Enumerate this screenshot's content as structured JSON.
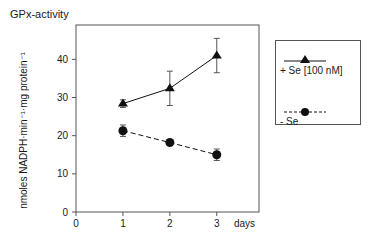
{
  "chart_data": {
    "type": "line",
    "title": "GPx-activity",
    "xlabel": "days",
    "ylabel": "nmoles NADPH·min⁻¹·mg protein⁻¹",
    "x": [
      1,
      2,
      3
    ],
    "xlim": [
      0,
      3.9
    ],
    "ylim": [
      0,
      49
    ],
    "xticks": [
      "0",
      "1",
      "2",
      "3"
    ],
    "yticks": [
      "0",
      "10",
      "20",
      "30",
      "40"
    ],
    "grid": false,
    "legend_position": "right",
    "series": [
      {
        "name": "+ Se [100 nM]",
        "marker": "triangle",
        "line_style": "solid",
        "values": [
          28.4,
          32.4,
          41.0
        ],
        "errors": [
          1.0,
          4.5,
          4.5
        ]
      },
      {
        "name": "- Se",
        "marker": "circle",
        "line_style": "dashed",
        "values": [
          21.3,
          18.2,
          15.0
        ],
        "errors": [
          1.5,
          0.6,
          1.5
        ]
      }
    ]
  },
  "colors": {
    "axis": "#555555",
    "series": "#111111"
  }
}
